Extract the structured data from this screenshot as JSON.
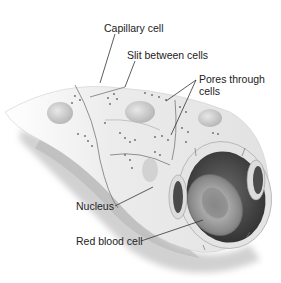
{
  "diagram": {
    "labels": {
      "capillary_cell": "Capillary cell",
      "slit_between_cells": "Slit between cells",
      "pores_line1": "Pores through",
      "pores_line2": "cells",
      "nucleus": "Nucleus",
      "red_blood_cell": "Red blood cell"
    },
    "colors": {
      "background": "#ffffff",
      "text": "#222222",
      "leader_line": "#333333",
      "vessel_wall": "#eeeeee",
      "vessel_shadow": "#8a8a8a",
      "lumen": "#4a4a4a",
      "rbc": "#9a9a9a"
    }
  }
}
